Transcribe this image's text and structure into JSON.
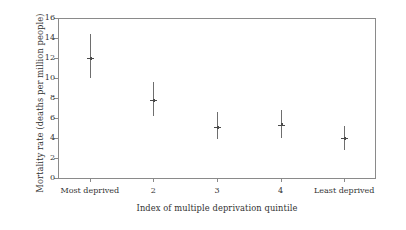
{
  "chart_data": {
    "type": "scatter",
    "title": "",
    "xlabel": "Index of multiple deprivation quintile",
    "ylabel": "Mortality rate (deaths per million people)",
    "categories": [
      "Most deprived",
      "2",
      "3",
      "4",
      "Least deprived"
    ],
    "values": [
      12.0,
      7.8,
      5.1,
      5.35,
      4.0
    ],
    "error_low": [
      10.0,
      6.2,
      3.9,
      4.0,
      2.8
    ],
    "error_high": [
      14.4,
      9.6,
      6.6,
      6.8,
      5.2
    ],
    "ylim": [
      0,
      16
    ],
    "ytick_labels": [
      "0",
      "2",
      "4",
      "6",
      "8",
      "10",
      "12",
      "14",
      "16"
    ],
    "ytick_values": [
      0,
      2,
      4,
      6,
      8,
      10,
      12,
      14,
      16
    ],
    "grid": false,
    "legend": "none",
    "series": [
      {
        "name": "Mortality rate",
        "points": [
          {
            "category": "Most deprived",
            "value": 12.0,
            "low": 10.0,
            "high": 14.4
          },
          {
            "category": "2",
            "value": 7.8,
            "low": 6.2,
            "high": 9.6
          },
          {
            "category": "3",
            "value": 5.1,
            "low": 3.9,
            "high": 6.6
          },
          {
            "category": "4",
            "value": 5.35,
            "low": 4.0,
            "high": 6.8
          },
          {
            "category": "Least deprived",
            "value": 4.0,
            "low": 2.8,
            "high": 5.2
          }
        ]
      }
    ],
    "colors": {
      "axis": "#8a8a8a",
      "marker": "#4a4a4a",
      "whisker": "#6e6e6e",
      "text": "#333333",
      "background": "#ffffff"
    }
  }
}
